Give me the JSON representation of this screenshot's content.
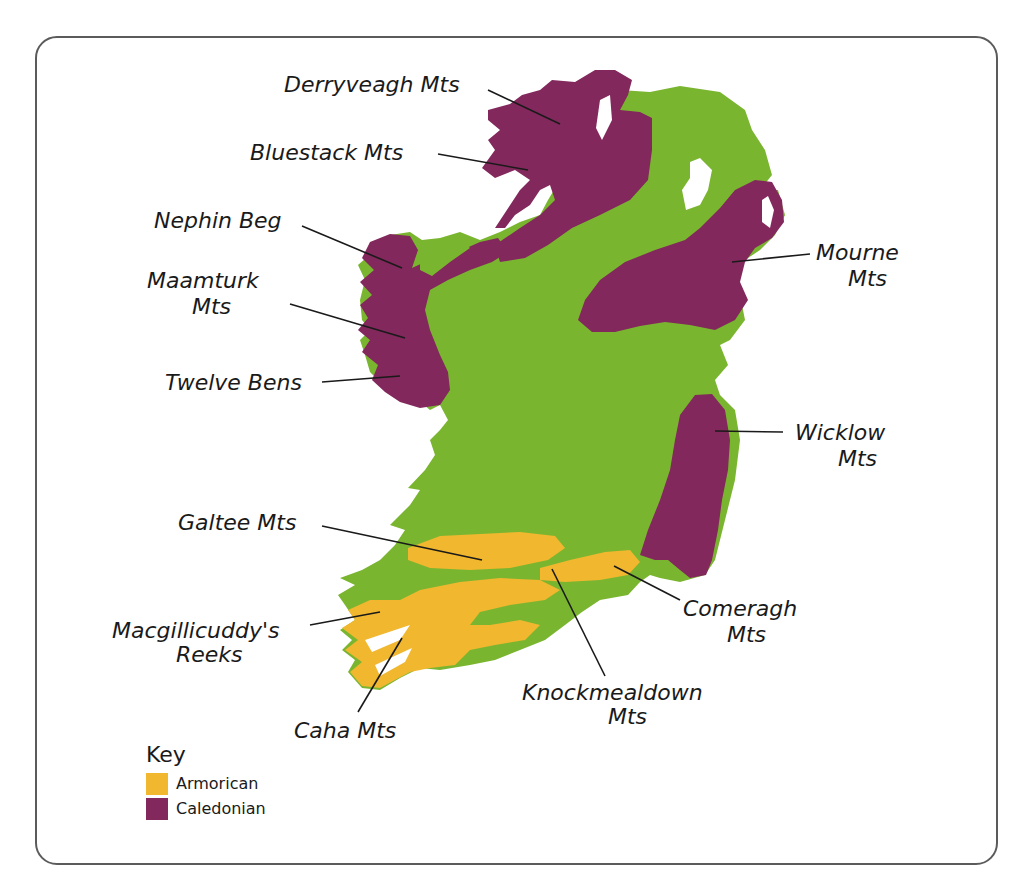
{
  "map": {
    "subject": "Mountain ranges of Ireland by orogeny",
    "colors": {
      "land": "#7ab530",
      "armorican": "#f0b72f",
      "caledonian": "#82285c",
      "sea": "#ffffff",
      "frame": "#5b5b5b"
    },
    "labels": {
      "derryveagh": "Derryveagh Mts",
      "bluestack": "Bluestack Mts",
      "nephin": "Nephin Beg",
      "maamturk_1": "Maamturk",
      "maamturk_2": "Mts",
      "twelve_bens": "Twelve Bens",
      "mourne_1": "Mourne",
      "mourne_2": "Mts",
      "wicklow_1": "Wicklow",
      "wicklow_2": "Mts",
      "galtee": "Galtee Mts",
      "macgillicuddy_1": "Macgillicuddy's",
      "macgillicuddy_2": "Reeks",
      "caha": "Caha Mts",
      "knockmealdown_1": "Knockmealdown",
      "knockmealdown_2": "Mts",
      "comeragh_1": "Comeragh",
      "comeragh_2": "Mts"
    },
    "key": {
      "title": "Key",
      "items": [
        {
          "label": "Armorican",
          "color": "#f0b72f"
        },
        {
          "label": "Caledonian",
          "color": "#82285c"
        }
      ]
    }
  }
}
